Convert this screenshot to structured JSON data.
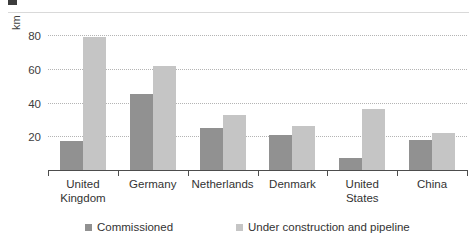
{
  "chart_data": {
    "type": "bar",
    "title": "",
    "subtitle": "",
    "xlabel": "",
    "ylabel": "km",
    "ylim": [
      0,
      88
    ],
    "yticks": [
      20,
      40,
      60,
      80
    ],
    "ytick_labels": [
      "20",
      "40",
      "60",
      "80"
    ],
    "grid": true,
    "grid_style": "dotted horizontal",
    "legend_position": "bottom",
    "categories": [
      "United\nKingdom",
      "Germany",
      "Netherlands",
      "Denmark",
      "United\nStates",
      "China"
    ],
    "series": [
      {
        "name": "Commissioned",
        "color": "#919191",
        "values": [
          17,
          45,
          25,
          21,
          7,
          18
        ]
      },
      {
        "name": "Under construction and pipeline",
        "color": "#c5c5c5",
        "values": [
          79,
          62,
          33,
          26,
          36,
          22
        ]
      }
    ]
  },
  "axis": {
    "y_title": "km",
    "tick_labels": [
      "20",
      "40",
      "60",
      "80"
    ]
  },
  "categories": [
    {
      "line1": "United",
      "line2": "Kingdom"
    },
    {
      "line1": "Germany",
      "line2": ""
    },
    {
      "line1": "Netherlands",
      "line2": ""
    },
    {
      "line1": "Denmark",
      "line2": ""
    },
    {
      "line1": "United",
      "line2": "States"
    },
    {
      "line1": "China",
      "line2": ""
    }
  ],
  "legend": {
    "items": [
      {
        "label": "Commissioned",
        "color": "#919191"
      },
      {
        "label": "Under construction and pipeline",
        "color": "#c5c5c5"
      }
    ]
  }
}
